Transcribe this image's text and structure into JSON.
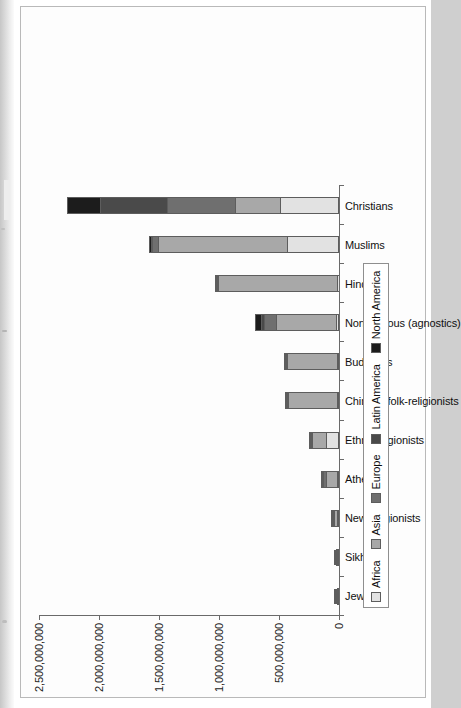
{
  "page": {
    "kind": "scanned-book-page",
    "orientation": "rotated-90-ccw"
  },
  "chart_data": {
    "type": "bar",
    "subtype": "stacked-vertical",
    "title": "",
    "xlabel": "",
    "ylabel": "",
    "ylim": [
      0,
      2500000000
    ],
    "grid": false,
    "legend_position": "bottom",
    "categories": [
      "Jews",
      "Sikhs",
      "New religionists",
      "Atheists",
      "Ethnoreligionists",
      "Chinese folk-religionists",
      "Buddhists",
      "Nonreligious (agnostics)",
      "Hindus",
      "Muslims",
      "Christians"
    ],
    "ytick_labels": [
      "0",
      "500,000,000",
      "1,000,000,000",
      "1,500,000,000",
      "2,000,000,000",
      "2,500,000,000"
    ],
    "ytick_values": [
      0,
      500000000,
      1000000000,
      1500000000,
      2000000000,
      2500000000
    ],
    "series": [
      {
        "name": "Africa",
        "color": "#e2e2e2",
        "values": [
          200000,
          60000,
          100000,
          600000,
          110000000,
          30000,
          250000,
          6000000,
          2600000,
          430000000,
          490000000
        ]
      },
      {
        "name": "Asia",
        "color": "#a8a8a8",
        "values": [
          6000000,
          24000000,
          62000000,
          125000000,
          135000000,
          450000000,
          455000000,
          530000000,
          1030000000,
          1100000000,
          370000000
        ]
      },
      {
        "name": "Europe",
        "color": "#6f6f6f",
        "values": [
          2000000,
          500000,
          400000,
          20000000,
          1000000,
          500000,
          1800000,
          100000000,
          1500000,
          45000000,
          570000000
        ]
      },
      {
        "name": "Latin America",
        "color": "#4a4a4a",
        "values": [
          1200000,
          50000,
          1000000,
          3000000,
          3000000,
          200000,
          800000,
          22000000,
          800000,
          2000000,
          560000000
        ]
      },
      {
        "name": "North America",
        "color": "#1c1c1c",
        "values": [
          6000000,
          700000,
          1800000,
          2500000,
          1000000,
          200000,
          3500000,
          42000000,
          1700000,
          6000000,
          280000000
        ]
      }
    ],
    "totals": [
      15400000,
      25310000,
      65300000,
      151100000,
      250110000,
      450930000,
      461350000,
      700000000,
      1036600000,
      1583000000,
      2270000000
    ]
  },
  "legend": {
    "items": [
      {
        "label": "Africa",
        "color": "#e2e2e2"
      },
      {
        "label": "Asia",
        "color": "#a8a8a8"
      },
      {
        "label": "Europe",
        "color": "#6f6f6f"
      },
      {
        "label": "Latin America",
        "color": "#4a4a4a"
      },
      {
        "label": "North America",
        "color": "#1c1c1c"
      }
    ]
  }
}
